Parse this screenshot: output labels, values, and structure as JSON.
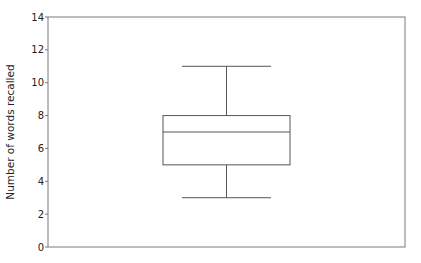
{
  "chart_data": {
    "type": "box",
    "title": "",
    "xlabel": "",
    "ylabel": "Number of words recalled",
    "ylim": [
      0,
      14
    ],
    "yticks": [
      0,
      2,
      4,
      6,
      8,
      10,
      12,
      14
    ],
    "grid": false,
    "legend": null,
    "series": [
      {
        "name": "",
        "whisker_low": 3,
        "q1": 5,
        "median": 7,
        "q3": 8,
        "whisker_high": 11
      }
    ]
  },
  "colors": {
    "frame": "#7a7a7a",
    "box": "#555555",
    "text": "#222222"
  }
}
